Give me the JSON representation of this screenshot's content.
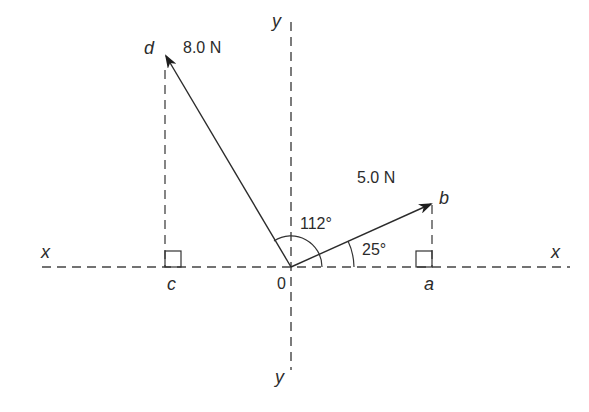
{
  "diagram": {
    "type": "force-vector-diagram",
    "origin_label": "0",
    "axes": {
      "x_left_label": "x",
      "x_right_label": "x",
      "y_top_label": "y",
      "y_bottom_label": "y"
    },
    "vectors": [
      {
        "name": "d",
        "magnitude_label": "8.0 N",
        "angle_label": "112°",
        "angle_deg": 112
      },
      {
        "name": "b",
        "magnitude_label": "5.0 N",
        "angle_label": "25°",
        "angle_deg": 25
      }
    ],
    "projections": {
      "c_label": "c",
      "a_label": "a"
    },
    "colors": {
      "line": "#2b2b2b",
      "axis": "#444444",
      "background": "#ffffff"
    }
  }
}
